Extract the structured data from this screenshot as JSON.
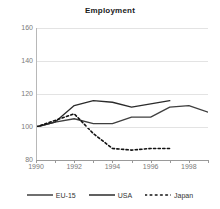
{
  "chart_data": {
    "type": "line",
    "title": "Employment",
    "xlabel": "",
    "ylabel": "",
    "xlim": [
      1990,
      1999
    ],
    "ylim": [
      80,
      160
    ],
    "yticks": [
      80,
      100,
      120,
      140,
      160
    ],
    "xticks": [
      1990,
      1991,
      1992,
      1993,
      1994,
      1995,
      1996,
      1997,
      1998,
      1999
    ],
    "xtick_labels": [
      "1990",
      "",
      "1992",
      "",
      "1994",
      "",
      "1996",
      "",
      "1998",
      ""
    ],
    "grid": true,
    "legend_position": "bottom",
    "x": [
      1990,
      1991,
      1992,
      1993,
      1994,
      1995,
      1996,
      1997,
      1998,
      1999
    ],
    "series": [
      {
        "name": "EU-15",
        "style": "solid",
        "color": "#3f3f3f",
        "values": [
          100,
          103,
          105,
          102,
          102,
          106,
          106,
          112,
          113,
          109
        ]
      },
      {
        "name": "USA",
        "style": "solid",
        "color": "#2b2b2b",
        "values": [
          100,
          103,
          113,
          116,
          115,
          112,
          114,
          116,
          null,
          null
        ]
      },
      {
        "name": "Japan",
        "style": "dotted",
        "color": "#111111",
        "values": [
          100,
          104,
          108,
          96,
          87,
          86,
          87,
          87,
          null,
          null
        ]
      }
    ]
  },
  "legend": {
    "items": [
      {
        "label": "EU-15",
        "style": "solid"
      },
      {
        "label": "USA",
        "style": "solid"
      },
      {
        "label": "Japan",
        "style": "dotted"
      }
    ]
  },
  "colors": {
    "grid": "#e3e3e3",
    "axis": "#9a9a9a",
    "tick_text": "#7a7a7a",
    "title_text": "#1a1a1a"
  }
}
